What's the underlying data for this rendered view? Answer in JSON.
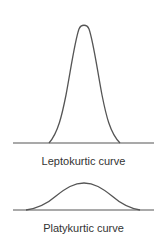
{
  "diagrams": [
    {
      "label": "Leptokurtic curve",
      "type": "leptokurtic"
    },
    {
      "label": "Platykurtic curve",
      "type": "platykurtic"
    }
  ],
  "colors": {
    "stroke": "#555555",
    "text": "#333333",
    "background": "#ffffff"
  }
}
